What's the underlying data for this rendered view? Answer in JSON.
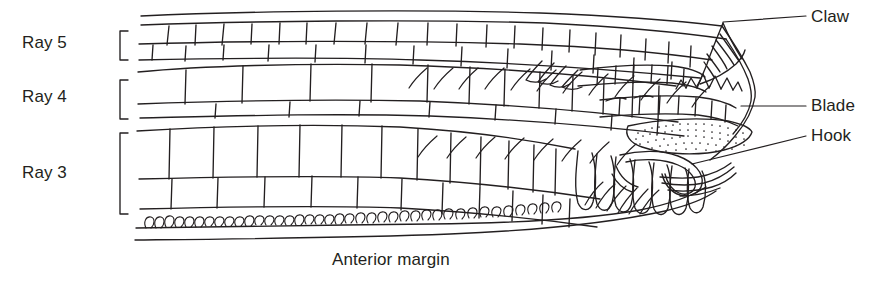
{
  "figure": {
    "background_color": "#ffffff",
    "ink_color": "#231f20",
    "caption": "Anterior margin",
    "left_labels": [
      {
        "id": "ray5",
        "label": "Ray 5"
      },
      {
        "id": "ray4",
        "label": "Ray 4"
      },
      {
        "id": "ray3",
        "label": "Ray 3"
      }
    ],
    "right_labels": [
      {
        "id": "claw",
        "label": "Claw"
      },
      {
        "id": "blade",
        "label": "Blade"
      },
      {
        "id": "hook",
        "label": "Hook"
      }
    ],
    "brackets": [
      {
        "id": "bracket-ray5",
        "for": "Ray 5"
      },
      {
        "id": "bracket-ray4",
        "for": "Ray 4"
      },
      {
        "id": "bracket-ray3",
        "for": "Ray 3"
      }
    ]
  }
}
